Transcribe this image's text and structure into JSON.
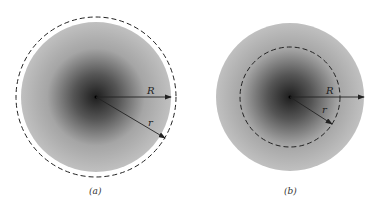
{
  "figure": {
    "panels": [
      {
        "id": "a",
        "caption": "(a)",
        "label_R": "R",
        "label_r": "r",
        "gaussian_surface": "outside sphere (r > R)"
      },
      {
        "id": "b",
        "caption": "(b)",
        "label_R": "R",
        "label_r": "r",
        "gaussian_surface": "inside sphere (r < R)"
      }
    ],
    "colors": {
      "center": "#1e1e1e",
      "edge": "#bdbdbd",
      "dashed": "#222222"
    }
  }
}
